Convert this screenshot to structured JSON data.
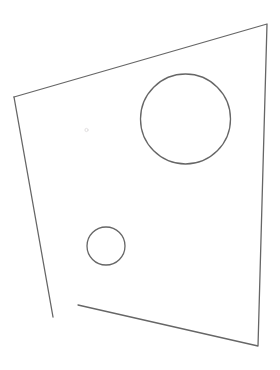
{
  "canvas": {
    "width": 280,
    "height": 370,
    "background_color": "#ffffff",
    "title": "Technical Line Drawing"
  },
  "style": {
    "stroke_color": "#666666",
    "stroke_width": 1.3,
    "faint_stroke_color": "#e2dfe0",
    "faint_stroke_width": 1.0
  },
  "shapes": {
    "outline": {
      "name": "quadrilateral-plate-outline",
      "type": "open-polyline",
      "description": "Irregular four-sided plate outline, open at the lower-left corner",
      "segments": [
        {
          "name": "top-and-right-and-bottom-chain",
          "points": [
            [
              14,
              97
            ],
            [
              267,
              24
            ],
            [
              258,
              346
            ],
            [
              78,
              305
            ]
          ]
        },
        {
          "name": "left-edge-partial",
          "points": [
            [
              14,
              97
            ],
            [
              53,
              317
            ]
          ]
        }
      ],
      "vertices": {
        "top_left": [
          14,
          97
        ],
        "top_right": [
          267,
          24
        ],
        "bottom_right": [
          258,
          346
        ],
        "bottom_left_open_end": [
          78,
          305
        ],
        "left_edge_open_end": [
          53,
          317
        ]
      }
    },
    "large_circle": {
      "name": "large-hole",
      "type": "circle",
      "cx": 185.5,
      "cy": 119,
      "r": 45
    },
    "small_circle": {
      "name": "small-hole",
      "type": "circle",
      "cx": 106,
      "cy": 246,
      "r": 19
    },
    "faint_mark": {
      "name": "faint-speck-mark",
      "type": "dot",
      "cx": 86.5,
      "cy": 130,
      "r": 1.6
    }
  }
}
